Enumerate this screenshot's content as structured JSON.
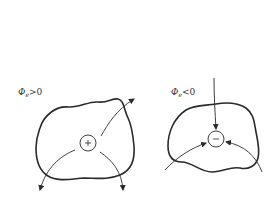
{
  "diagram": {
    "type": "electric-flux-gauss-surfaces",
    "panels": [
      {
        "id": "positive",
        "label": {
          "symbol": "Φ",
          "subscript": "e",
          "relation": ">0"
        },
        "charge_sign": "+",
        "field_direction": "outward"
      },
      {
        "id": "negative",
        "label": {
          "symbol": "Φ",
          "subscript": "e",
          "relation": "<0"
        },
        "charge_sign": "−",
        "field_direction": "inward"
      }
    ],
    "colors": {
      "stroke": "#2a2a2a",
      "background": "#ffffff"
    }
  }
}
